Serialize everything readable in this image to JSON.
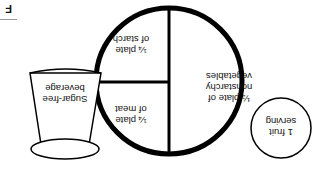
{
  "diagram": {
    "orientation": "rotated 180 degrees",
    "corner_label": "F",
    "plate": {
      "sections": [
        {
          "id": "nonstarchy",
          "label_line1": "½ plate of",
          "label_line2": "nonstarchy",
          "label_line3": "vegetables",
          "fraction": "1/2"
        },
        {
          "id": "meat",
          "label_line1": "¼ plate",
          "label_line2": "of meat",
          "fraction": "1/4"
        },
        {
          "id": "starch",
          "label_line1": "¼ plate",
          "label_line2": "of starch",
          "fraction": "1/4"
        }
      ]
    },
    "fruit": {
      "label_line1": "1 fruit",
      "label_line2": "serving"
    },
    "beverage": {
      "label_line1": "Sugar-free",
      "label_line2": "beverage"
    },
    "colors": {
      "stroke": "#000000",
      "background": "#ffffff",
      "text": "#111111"
    }
  }
}
